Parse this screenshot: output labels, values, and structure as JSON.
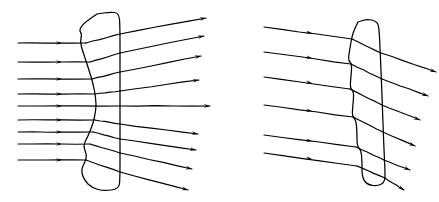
{
  "figure": {
    "background_color": "#ffffff",
    "line_color": "#000000",
    "width": 439,
    "height": 202,
    "panel_count": 2
  },
  "chart_data": {
    "type": "diagram",
    "xlabel": "",
    "ylabel": "",
    "grid": false,
    "legend": "none",
    "xlim": [
      0,
      439
    ],
    "ylim": [
      0,
      202
    ],
    "panels": [
      {
        "name": "conventional-lens-panel",
        "label": "",
        "lens_type": "plano-convex",
        "lens_outline_points": [
          [
            97,
            14
          ],
          [
            110,
            12
          ],
          [
            119,
            13
          ],
          [
            120,
            26
          ],
          [
            120,
            60
          ],
          [
            120,
            105
          ],
          [
            120,
            150
          ],
          [
            120,
            178
          ],
          [
            119,
            189
          ],
          [
            104,
            191
          ],
          [
            92,
            188
          ],
          [
            84,
            180
          ],
          [
            81,
            170
          ],
          [
            85,
            162
          ],
          [
            87,
            155
          ],
          [
            83,
            146
          ],
          [
            88,
            136
          ],
          [
            93,
            124
          ],
          [
            96,
            110
          ],
          [
            96,
            99
          ],
          [
            93,
            83
          ],
          [
            88,
            67
          ],
          [
            83,
            52
          ],
          [
            80,
            42
          ],
          [
            82,
            34
          ],
          [
            79,
            30
          ],
          [
            84,
            23
          ],
          [
            97,
            14
          ]
        ],
        "flat_face_x": 120,
        "curved_apex_x": 96,
        "incoming_ray_count": 8,
        "outgoing_ray_count": 8,
        "incoming_rays": [
          {
            "x1": 18,
            "y1": 43,
            "x2": 86,
            "y2": 43,
            "arrow_x": 62,
            "arrow_y": 43
          },
          {
            "x1": 18,
            "y1": 62,
            "x2": 90,
            "y2": 62,
            "arrow_x": 62,
            "arrow_y": 62
          },
          {
            "x1": 18,
            "y1": 79,
            "x2": 92,
            "y2": 79,
            "arrow_x": 62,
            "arrow_y": 79
          },
          {
            "x1": 18,
            "y1": 94,
            "x2": 95,
            "y2": 94,
            "arrow_x": 62,
            "arrow_y": 94
          },
          {
            "x1": 18,
            "y1": 106,
            "x2": 120,
            "y2": 106,
            "arrow_x": 62,
            "arrow_y": 106
          },
          {
            "x1": 18,
            "y1": 120,
            "x2": 95,
            "y2": 120,
            "arrow_x": 62,
            "arrow_y": 120
          },
          {
            "x1": 18,
            "y1": 132,
            "x2": 93,
            "y2": 132,
            "arrow_x": 62,
            "arrow_y": 132
          },
          {
            "x1": 18,
            "y1": 144,
            "x2": 90,
            "y2": 144,
            "arrow_x": 62,
            "arrow_y": 144
          },
          {
            "x1": 18,
            "y1": 160,
            "x2": 86,
            "y2": 160,
            "arrow_x": 62,
            "arrow_y": 160
          }
        ],
        "internal_rays": [
          {
            "x1": 86,
            "y1": 43,
            "x2": 120,
            "y2": 34
          },
          {
            "x1": 90,
            "y1": 62,
            "x2": 120,
            "y2": 53
          },
          {
            "x1": 92,
            "y1": 79,
            "x2": 120,
            "y2": 72
          },
          {
            "x1": 95,
            "y1": 94,
            "x2": 120,
            "y2": 91
          },
          {
            "x1": 95,
            "y1": 120,
            "x2": 120,
            "y2": 124
          },
          {
            "x1": 93,
            "y1": 132,
            "x2": 120,
            "y2": 139
          },
          {
            "x1": 90,
            "y1": 144,
            "x2": 120,
            "y2": 153
          },
          {
            "x1": 86,
            "y1": 160,
            "x2": 120,
            "y2": 172
          }
        ],
        "outgoing_rays": [
          {
            "x1": 120,
            "y1": 34,
            "x2": 206,
            "y2": 18,
            "tip_x": 206,
            "tip_y": 18
          },
          {
            "x1": 120,
            "y1": 53,
            "x2": 204,
            "y2": 36,
            "tip_x": 204,
            "tip_y": 36
          },
          {
            "x1": 120,
            "y1": 72,
            "x2": 201,
            "y2": 56,
            "tip_x": 201,
            "tip_y": 56
          },
          {
            "x1": 120,
            "y1": 91,
            "x2": 199,
            "y2": 80,
            "tip_x": 199,
            "tip_y": 80
          },
          {
            "x1": 120,
            "y1": 106,
            "x2": 210,
            "y2": 106,
            "tip_x": 210,
            "tip_y": 106
          },
          {
            "x1": 120,
            "y1": 124,
            "x2": 198,
            "y2": 134,
            "tip_x": 198,
            "tip_y": 134
          },
          {
            "x1": 120,
            "y1": 139,
            "x2": 196,
            "y2": 150,
            "tip_x": 196,
            "tip_y": 150
          },
          {
            "x1": 120,
            "y1": 153,
            "x2": 192,
            "y2": 169,
            "tip_x": 192,
            "tip_y": 169
          },
          {
            "x1": 120,
            "y1": 172,
            "x2": 188,
            "y2": 190,
            "tip_x": 188,
            "tip_y": 190
          }
        ]
      },
      {
        "name": "fresnel-lens-panel",
        "label": "",
        "lens_type": "fresnel",
        "lens_outline_points": [
          [
            358,
            22
          ],
          [
            367,
            19
          ],
          [
            376,
            21
          ],
          [
            379,
            26
          ],
          [
            380,
            48
          ],
          [
            381,
            70
          ],
          [
            382,
            96
          ],
          [
            383,
            124
          ],
          [
            384,
            150
          ],
          [
            385,
            170
          ],
          [
            385,
            182
          ],
          [
            378,
            186
          ],
          [
            368,
            185
          ],
          [
            362,
            178
          ],
          [
            362,
            160
          ],
          [
            361,
            150
          ],
          [
            357,
            146
          ],
          [
            357,
            132
          ],
          [
            356,
            120
          ],
          [
            352,
            116
          ],
          [
            353,
            104
          ],
          [
            354,
            92
          ],
          [
            350,
            88
          ],
          [
            351,
            76
          ],
          [
            352,
            64
          ],
          [
            348,
            60
          ],
          [
            350,
            48
          ],
          [
            352,
            36
          ],
          [
            355,
            28
          ],
          [
            358,
            22
          ]
        ],
        "flat_face_x": 384,
        "facet_count": 4,
        "incoming_ray_count": 6,
        "outgoing_ray_count": 6,
        "incoming_rays": [
          {
            "x1": 264,
            "y1": 27,
            "x2": 352,
            "y2": 39,
            "arrow_x": 312,
            "arrow_y": 33
          },
          {
            "x1": 264,
            "y1": 52,
            "x2": 351,
            "y2": 64,
            "arrow_x": 312,
            "arrow_y": 58
          },
          {
            "x1": 264,
            "y1": 77,
            "x2": 350,
            "y2": 89,
            "arrow_x": 312,
            "arrow_y": 83
          },
          {
            "x1": 264,
            "y1": 105,
            "x2": 353,
            "y2": 117,
            "arrow_x": 312,
            "arrow_y": 111
          },
          {
            "x1": 264,
            "y1": 135,
            "x2": 356,
            "y2": 147,
            "arrow_x": 312,
            "arrow_y": 141
          },
          {
            "x1": 264,
            "y1": 153,
            "x2": 357,
            "y2": 166,
            "arrow_x": 312,
            "arrow_y": 159
          }
        ],
        "internal_rays": [
          {
            "x1": 352,
            "y1": 39,
            "x2": 381,
            "y2": 53
          },
          {
            "x1": 351,
            "y1": 64,
            "x2": 382,
            "y2": 79
          },
          {
            "x1": 350,
            "y1": 89,
            "x2": 382,
            "y2": 105
          },
          {
            "x1": 353,
            "y1": 117,
            "x2": 383,
            "y2": 132
          },
          {
            "x1": 356,
            "y1": 147,
            "x2": 384,
            "y2": 160
          },
          {
            "x1": 357,
            "y1": 166,
            "x2": 385,
            "y2": 178
          }
        ],
        "outgoing_rays": [
          {
            "x1": 381,
            "y1": 53,
            "x2": 436,
            "y2": 72,
            "tip_x": 436,
            "tip_y": 72
          },
          {
            "x1": 382,
            "y1": 79,
            "x2": 428,
            "y2": 96,
            "tip_x": 428,
            "tip_y": 96
          },
          {
            "x1": 382,
            "y1": 105,
            "x2": 420,
            "y2": 120,
            "tip_x": 420,
            "tip_y": 120
          },
          {
            "x1": 383,
            "y1": 132,
            "x2": 415,
            "y2": 146,
            "tip_x": 415,
            "tip_y": 146
          },
          {
            "x1": 384,
            "y1": 160,
            "x2": 410,
            "y2": 170,
            "tip_x": 410,
            "tip_y": 170
          },
          {
            "x1": 385,
            "y1": 178,
            "x2": 404,
            "y2": 190,
            "tip_x": 404,
            "tip_y": 190
          }
        ]
      }
    ]
  }
}
